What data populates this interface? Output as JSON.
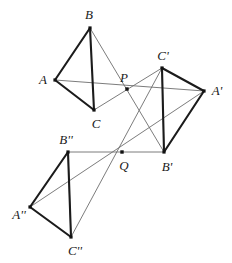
{
  "figure": {
    "type": "geometry-diagram",
    "width": 232,
    "height": 263,
    "background_color": "#ffffff",
    "thick_stroke_color": "#1b1b1b",
    "thin_stroke_color": "#6d6d6d",
    "vertex_dot_color": "#111111",
    "thick_stroke_width": 2.1,
    "thin_stroke_width": 0.9,
    "vertex_dot_size": 3.2,
    "center_dot_size": 3.4
  },
  "points": [
    {
      "id": "B",
      "label": "B",
      "x": 90,
      "y": 28,
      "label_x": 89,
      "label_y": 14,
      "kind": "vertex"
    },
    {
      "id": "A",
      "label": "A",
      "x": 55,
      "y": 80,
      "label_x": 43,
      "label_y": 79,
      "kind": "vertex"
    },
    {
      "id": "C",
      "label": "C",
      "x": 94,
      "y": 110,
      "label_x": 96,
      "label_y": 123,
      "kind": "vertex"
    },
    {
      "id": "P",
      "label": "P",
      "x": 127,
      "y": 89,
      "label_x": 124,
      "label_y": 77,
      "kind": "center"
    },
    {
      "id": "Cp",
      "label": "C'",
      "x": 162,
      "y": 68,
      "label_x": 163,
      "label_y": 55,
      "kind": "vertex"
    },
    {
      "id": "Ap",
      "label": "A'",
      "x": 204,
      "y": 91,
      "label_x": 217,
      "label_y": 90,
      "kind": "vertex"
    },
    {
      "id": "Bp",
      "label": "B'",
      "x": 164,
      "y": 152,
      "label_x": 167,
      "label_y": 166,
      "kind": "vertex"
    },
    {
      "id": "Q",
      "label": "Q",
      "x": 122,
      "y": 152,
      "label_x": 124,
      "label_y": 165,
      "kind": "center"
    },
    {
      "id": "Bpp",
      "label": "B''",
      "x": 68,
      "y": 152,
      "label_x": 66,
      "label_y": 139,
      "kind": "vertex"
    },
    {
      "id": "App",
      "label": "A''",
      "x": 30,
      "y": 207,
      "label_x": 19,
      "label_y": 214,
      "kind": "vertex"
    },
    {
      "id": "Cpp",
      "label": "C''",
      "x": 71,
      "y": 237,
      "label_x": 75,
      "label_y": 250,
      "kind": "vertex"
    }
  ],
  "thick_edges": [
    {
      "name": "edge-A-B",
      "from": "A",
      "to": "B"
    },
    {
      "name": "edge-B-C",
      "from": "B",
      "to": "C"
    },
    {
      "name": "edge-A-C",
      "from": "A",
      "to": "C"
    },
    {
      "name": "edge-Cp-Ap",
      "from": "Cp",
      "to": "Ap"
    },
    {
      "name": "edge-Ap-Bp",
      "from": "Ap",
      "to": "Bp"
    },
    {
      "name": "edge-Cp-Bp",
      "from": "Cp",
      "to": "Bp"
    },
    {
      "name": "edge-App-Bpp",
      "from": "App",
      "to": "Bpp"
    },
    {
      "name": "edge-Bpp-Cpp",
      "from": "Bpp",
      "to": "Cpp"
    },
    {
      "name": "edge-App-Cpp",
      "from": "App",
      "to": "Cpp"
    }
  ],
  "thin_edges": [
    {
      "name": "ray-A-to-Ap-through-P",
      "from": "A",
      "to": "Ap"
    },
    {
      "name": "ray-B-to-Bp-through-P",
      "from": "B",
      "to": "Bp"
    },
    {
      "name": "ray-C-to-Cp-through-P",
      "from": "C",
      "to": "Cp"
    },
    {
      "name": "ray-Bpp-to-Bp-through-Q",
      "from": "Bpp",
      "to": "Bp"
    },
    {
      "name": "ray-App-to-Ap-through-Q",
      "from": "App",
      "to": "Ap"
    },
    {
      "name": "ray-Cpp-to-Cp-through-Q",
      "from": "Cpp",
      "to": "Cp"
    },
    {
      "name": "chord-Bpp-Cpp-inner",
      "from": "Bpp",
      "to": "Cpp"
    },
    {
      "name": "chord-Cp-Bp-inner",
      "from": "Cp",
      "to": "Bp"
    }
  ]
}
